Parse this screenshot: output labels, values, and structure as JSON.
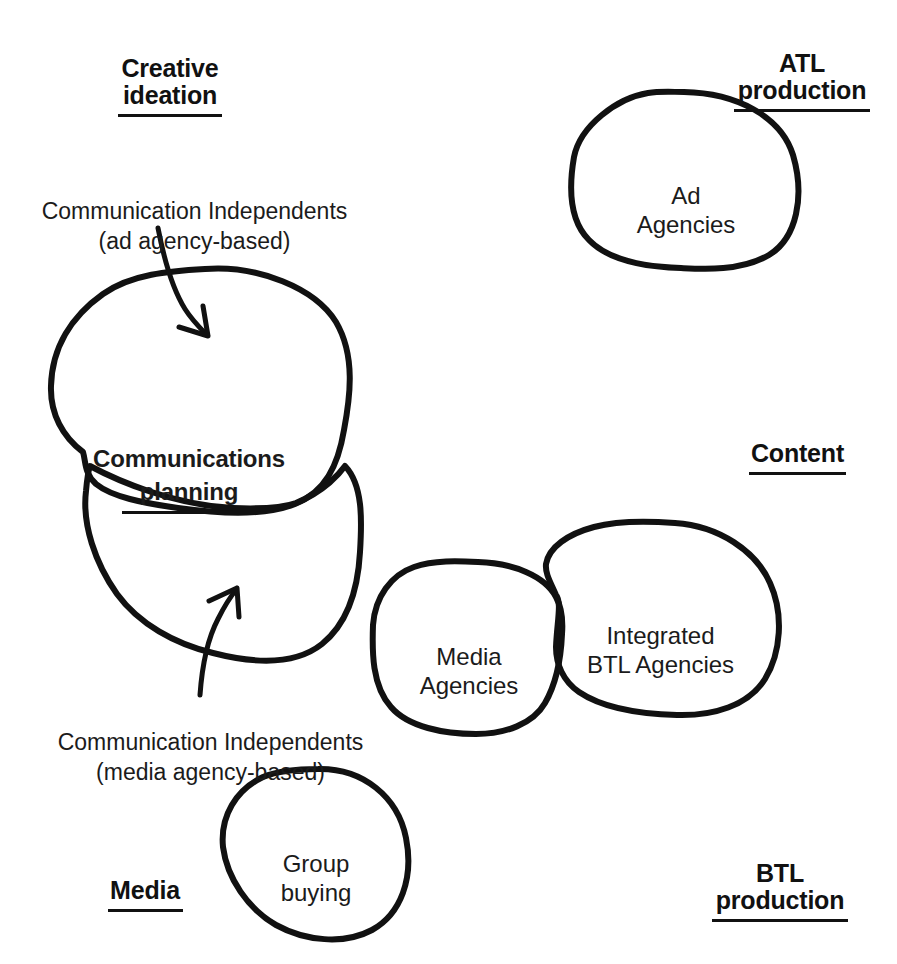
{
  "diagram": {
    "title_visible": false,
    "background_color": "#ffffff",
    "ink_color": "#111111",
    "axis_labels": [
      {
        "id": "creative-ideation",
        "text": "Creative\nideation",
        "underline": true
      },
      {
        "id": "atl-production",
        "text": "ATL\nproduction",
        "underline": true
      },
      {
        "id": "content",
        "text": "Content",
        "underline": true
      },
      {
        "id": "media",
        "text": "Media",
        "underline": true
      },
      {
        "id": "btl-production",
        "text": "BTL\nproduction",
        "underline": true
      }
    ],
    "blobs": [
      {
        "id": "ad-agencies",
        "label": "Ad\nAgencies",
        "bold": false,
        "underline": false
      },
      {
        "id": "communications-planning",
        "label": "Communications\nplanning",
        "bold": true,
        "underline": true
      },
      {
        "id": "communication-independents-media",
        "label": "",
        "bold": false,
        "underline": false
      },
      {
        "id": "media-agencies",
        "label": "Media\nAgencies",
        "bold": false,
        "underline": false
      },
      {
        "id": "integrated-btl-agencies",
        "label": "Integrated\nBTL Agencies",
        "bold": false,
        "underline": false
      },
      {
        "id": "group-buying",
        "label": "Group\nbuying",
        "bold": false,
        "underline": false
      }
    ],
    "callouts": [
      {
        "id": "callout-ad-agency-based",
        "text": "Communication Independents\n(ad agency-based)"
      },
      {
        "id": "callout-media-agency-based",
        "text": "Communication Independents\n(media agency-based)"
      }
    ]
  }
}
